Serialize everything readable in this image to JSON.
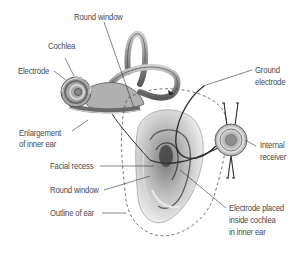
{
  "diagram": {
    "labels": {
      "round_window_top": "Round window",
      "cochlea": "Cochlea",
      "electrode": "Electrode",
      "enlargement_line1": "Enlargement",
      "enlargement_line2": "of inner ear",
      "facial_recess": "Facial recess",
      "round_window_bottom": "Round window",
      "outline_of_ear": "Outline of ear",
      "ground_line1": "Ground",
      "ground_line2": "electrode",
      "internal_line1": "Internal",
      "internal_line2": "receiver",
      "placed_line1": "Electrode placed",
      "placed_line2": "inside cochlea",
      "placed_line3": "in inner ear"
    },
    "colors": {
      "background": "#ffffff",
      "label_text": "#4a4a4a",
      "leader_line": "#333333",
      "tissue_dark": "#555555",
      "tissue_mid": "#9a9a9a",
      "tissue_light": "#d8d8d8"
    }
  }
}
